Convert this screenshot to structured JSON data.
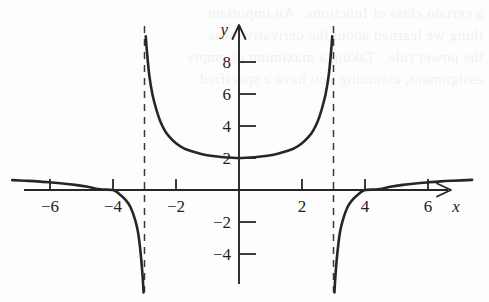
{
  "figure": {
    "background_color": "#fdfdfd",
    "ink_color": "#262626",
    "showthrough_text": "a certain class of functions.  An important\nthing we learned about the derivative was\nthe power rule.  Taking a maximum or empty\nassignment, assuming you have a specified"
  },
  "axes": {
    "x_label": "x",
    "y_label": "y",
    "x_ticks": [
      {
        "value": -6,
        "label": "−6"
      },
      {
        "value": -4,
        "label": "−4"
      },
      {
        "value": -2,
        "label": "−2"
      },
      {
        "value": 2,
        "label": "2"
      },
      {
        "value": 4,
        "label": "4"
      },
      {
        "value": 6,
        "label": "6"
      }
    ],
    "y_ticks": [
      {
        "value": 8,
        "label": "8"
      },
      {
        "value": 6,
        "label": "6"
      },
      {
        "value": 4,
        "label": "4"
      },
      {
        "value": 2,
        "label": "2"
      },
      {
        "value": -2,
        "label": "−2"
      },
      {
        "value": -4,
        "label": "−4"
      }
    ],
    "xlim": [
      -7.2,
      7.6
    ],
    "ylim": [
      -6.4,
      9.6
    ],
    "x_arrow": true,
    "y_arrow": true,
    "grid": false
  },
  "chart_data": {
    "type": "line",
    "title": "",
    "xlabel": "x",
    "ylabel": "y",
    "xlim": [
      -7.2,
      7.6
    ],
    "ylim": [
      -6.4,
      9.6
    ],
    "grid": false,
    "legend": null,
    "asymptotes": {
      "vertical": [
        -3,
        3
      ],
      "vertical_style": "dashed",
      "horizontal_implied": 1
    },
    "x_intercepts": [
      -4,
      4
    ],
    "minimum_point": {
      "x": 0,
      "y": 2
    },
    "series": [
      {
        "name": "left-outer-branch",
        "x": [
          -7.2,
          -6.8,
          -6.4,
          -6.0,
          -5.6,
          -5.2,
          -4.8,
          -4.4,
          -4.0,
          -3.8,
          -3.6,
          -3.45,
          -3.3,
          -3.2,
          -3.12,
          -3.06,
          -3.03
        ],
        "y": [
          0.62,
          0.58,
          0.54,
          0.48,
          0.41,
          0.32,
          0.2,
          0.04,
          0.0,
          -0.25,
          -0.62,
          -1.05,
          -1.85,
          -2.7,
          -4.0,
          -5.4,
          -6.4
        ]
      },
      {
        "name": "middle-branch",
        "x": [
          -2.96,
          -2.92,
          -2.85,
          -2.75,
          -2.62,
          -2.5,
          -2.35,
          -2.2,
          -2.0,
          -1.75,
          -1.5,
          -1.2,
          -0.9,
          -0.5,
          0,
          0.5,
          0.9,
          1.2,
          1.5,
          1.75,
          2.0,
          2.2,
          2.35,
          2.5,
          2.62,
          2.75,
          2.85,
          2.92,
          2.96
        ],
        "y": [
          9.6,
          8.6,
          7.2,
          6.0,
          5.0,
          4.3,
          3.7,
          3.3,
          2.92,
          2.6,
          2.42,
          2.25,
          2.14,
          2.05,
          2.0,
          2.05,
          2.14,
          2.25,
          2.42,
          2.6,
          2.92,
          3.3,
          3.7,
          4.3,
          5.0,
          6.0,
          7.2,
          8.6,
          9.6
        ]
      },
      {
        "name": "right-outer-branch",
        "x": [
          3.03,
          3.06,
          3.12,
          3.2,
          3.3,
          3.45,
          3.6,
          3.8,
          4.0,
          4.4,
          4.8,
          5.2,
          5.6,
          6.0,
          6.4,
          6.8,
          7.4
        ],
        "y": [
          -6.4,
          -5.4,
          -4.0,
          -2.7,
          -1.85,
          -1.05,
          -0.62,
          -0.25,
          0.0,
          0.04,
          0.2,
          0.32,
          0.41,
          0.48,
          0.54,
          0.58,
          0.63
        ]
      }
    ]
  }
}
